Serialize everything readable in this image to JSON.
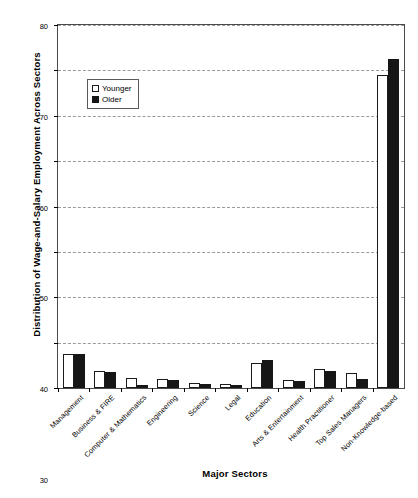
{
  "chart_data": {
    "type": "bar",
    "title": "",
    "xlabel": "Major Sectors",
    "ylabel": "Distribution of Wage-and-Salary Employment Across Sectors",
    "ylim": [
      0,
      80
    ],
    "yticks": [
      0,
      10,
      20,
      30,
      40,
      50,
      60,
      70,
      80
    ],
    "grid": true,
    "legend_position": "upper-left-inside",
    "categories": [
      "Management",
      "Business & FIRE",
      "Computer & Mathematics",
      "Engineering",
      "Science",
      "Legal",
      "Education",
      "Arts & Entertainment",
      "Health Practitioner",
      "Top Sales Managers",
      "Non-Knowledge-based"
    ],
    "series": [
      {
        "name": "Younger",
        "color": "#ffffff",
        "values": [
          7.5,
          3.8,
          2.3,
          1.9,
          1.2,
          0.9,
          5.5,
          1.7,
          4.2,
          3.2,
          69.0
        ]
      },
      {
        "name": "Older",
        "color": "#161616",
        "values": [
          7.5,
          3.5,
          0.7,
          1.8,
          0.8,
          0.7,
          6.1,
          1.5,
          3.7,
          1.9,
          72.5
        ]
      }
    ]
  },
  "legend": {
    "items": [
      {
        "label": "Younger",
        "marker": "open-square-marker"
      },
      {
        "label": "Older",
        "marker": "filled-square-marker"
      }
    ]
  },
  "axes": {
    "y_title": "Distribution of Wage-and-Salary Employment Across Sectors",
    "x_title": "Major Sectors"
  }
}
